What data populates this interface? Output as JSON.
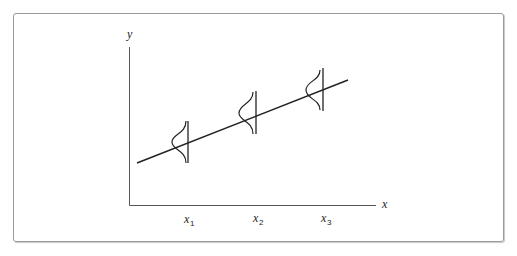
{
  "diagram": {
    "axes": {
      "x_label": "x",
      "y_label": "y"
    },
    "ticks": [
      {
        "base": "x",
        "sub": "1"
      },
      {
        "base": "x",
        "sub": "2"
      },
      {
        "base": "x",
        "sub": "3"
      }
    ],
    "elements": {
      "regression_line": "straight line increasing left to right",
      "distributions": [
        "normal curve at x1",
        "normal curve at x2",
        "normal curve at x3"
      ]
    }
  }
}
